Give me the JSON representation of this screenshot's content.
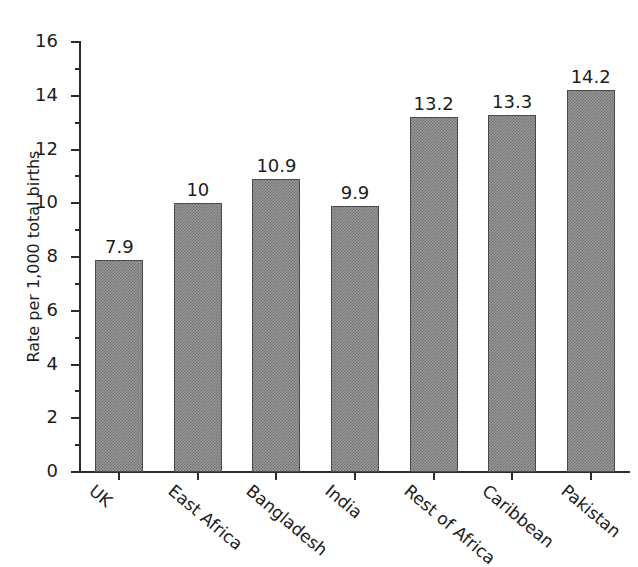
{
  "chart_data": {
    "type": "bar",
    "title": "",
    "xlabel": "",
    "ylabel": "Rate per 1,000 total births",
    "ylim": [
      0,
      16
    ],
    "ytick_step": 2,
    "minor_tick_step": 1,
    "grid": false,
    "legend": "none",
    "bar_fill": "#9a9a9a",
    "bar_edge": "#4a4a4a",
    "axis_color": "#2b2b2b",
    "background": "#ffffff",
    "categories": [
      "UK",
      "East Africa",
      "Bangladesh",
      "India",
      "Rest of Africa",
      "Caribbean",
      "Pakistan"
    ],
    "values": [
      7.9,
      10,
      10.9,
      9.9,
      13.2,
      13.3,
      14.2
    ],
    "value_labels": [
      "7.9",
      "10",
      "10.9",
      "9.9",
      "13.2",
      "13.3",
      "14.2"
    ],
    "ytick_labels": [
      "0",
      "2",
      "4",
      "6",
      "8",
      "10",
      "12",
      "14",
      "16"
    ],
    "ytick_values": [
      0,
      2,
      4,
      6,
      8,
      10,
      12,
      14,
      16
    ],
    "minor_tick_values": [
      1,
      3,
      5,
      7,
      9,
      11,
      13,
      15
    ]
  }
}
